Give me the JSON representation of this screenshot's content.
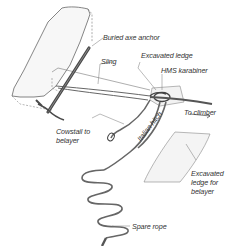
{
  "diagram": {
    "type": "illustration",
    "labels": {
      "buried_axe_anchor": "Buried axe anchor",
      "sling": "Sling",
      "excavated_ledge": "Excavated ledge",
      "hms_karabiner": "HMS karabiner",
      "to_climber": "To climber",
      "cowstail_line1": "Cowstail to",
      "cowstail_line2": "belayer",
      "italian_hitch": "Italian hitch",
      "excavated_ledge_belayer_line1": "Excavated",
      "excavated_ledge_belayer_line2": "ledge for",
      "excavated_ledge_belayer_line3": "belayer",
      "spare_rope": "Spare rope"
    },
    "colors": {
      "line": "#555555",
      "rope": "#666666",
      "axe": "#4a4a4a",
      "ledge_fill": "#eeeeee"
    }
  }
}
